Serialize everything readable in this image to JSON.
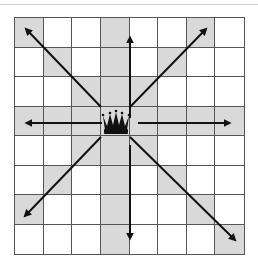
{
  "diagram": {
    "board": {
      "rows": 8,
      "cols": 8
    },
    "piece": {
      "name": "queen",
      "icon": "queen-crown-icon",
      "row": 3,
      "col": 3,
      "color": "#111111"
    },
    "colors": {
      "shade": "#d9d9d9",
      "light": "#ffffff",
      "line": "#555555",
      "arrow": "#111111"
    },
    "directions": [
      "north",
      "south",
      "east",
      "west",
      "north-east",
      "north-west",
      "south-east",
      "south-west"
    ],
    "shaded_cells": [
      [
        0,
        0
      ],
      [
        0,
        3
      ],
      [
        0,
        6
      ],
      [
        1,
        1
      ],
      [
        1,
        3
      ],
      [
        1,
        5
      ],
      [
        2,
        2
      ],
      [
        2,
        3
      ],
      [
        2,
        4
      ],
      [
        3,
        0
      ],
      [
        3,
        1
      ],
      [
        3,
        2
      ],
      [
        3,
        3
      ],
      [
        3,
        4
      ],
      [
        3,
        5
      ],
      [
        3,
        6
      ],
      [
        3,
        7
      ],
      [
        4,
        2
      ],
      [
        4,
        3
      ],
      [
        4,
        4
      ],
      [
        5,
        1
      ],
      [
        5,
        3
      ],
      [
        5,
        5
      ],
      [
        6,
        0
      ],
      [
        6,
        3
      ],
      [
        6,
        6
      ],
      [
        7,
        3
      ],
      [
        7,
        7
      ]
    ]
  }
}
